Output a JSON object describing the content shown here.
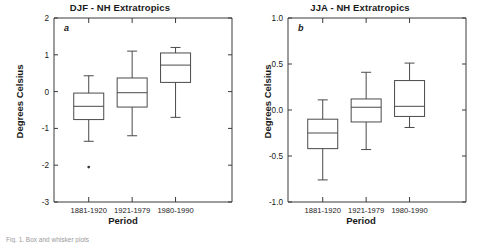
{
  "figure": {
    "caption": "Fig. 1. Box and whisker plots"
  },
  "panels": [
    {
      "letter": "a",
      "title": "DJF - NH Extratropics",
      "ylabel": "Degrees Celsius",
      "xlabel": "Period"
    },
    {
      "letter": "b",
      "title": "JJA - NH Extratropics",
      "ylabel": "Degrees Celsius",
      "xlabel": "Period"
    }
  ],
  "chart_data": [
    {
      "type": "box",
      "title": "DJF - NH Extratropics",
      "panel_letter": "a",
      "xlabel": "Period",
      "ylabel": "Degrees Celsius",
      "categories": [
        "1881-1920",
        "1921-1979",
        "1980-1990"
      ],
      "ylim": [
        -3,
        2
      ],
      "yticks": [
        2,
        1,
        0,
        -1,
        -2,
        -3
      ],
      "ytick_labels": [
        "2",
        "1",
        "0",
        "-1",
        "-2",
        "-3"
      ],
      "grid": false,
      "legend": "none",
      "boxes": [
        {
          "category": "1881-1920",
          "whisker_high": 0.43,
          "q3": -0.04,
          "median": -0.4,
          "q1": -0.76,
          "whisker_low": -1.35,
          "outliers": [
            -2.05
          ]
        },
        {
          "category": "1921-1979",
          "whisker_high": 1.1,
          "q3": 0.37,
          "median": -0.03,
          "q1": -0.42,
          "whisker_low": -1.2,
          "outliers": []
        },
        {
          "category": "1980-1990",
          "whisker_high": 1.2,
          "q3": 1.05,
          "median": 0.72,
          "q1": 0.25,
          "whisker_low": -0.7,
          "outliers": []
        }
      ]
    },
    {
      "type": "box",
      "title": "JJA - NH Extratropics",
      "panel_letter": "b",
      "xlabel": "Period",
      "ylabel": "Degrees Celsius",
      "categories": [
        "1881-1920",
        "1921-1979",
        "1980-1990"
      ],
      "ylim": [
        -1.0,
        1.0
      ],
      "yticks": [
        1.0,
        0.5,
        0.0,
        -0.5,
        -1.0
      ],
      "ytick_labels": [
        "1.0",
        "0.5",
        "0.0",
        "-0.5",
        "-1.0"
      ],
      "grid": false,
      "legend": "none",
      "boxes": [
        {
          "category": "1881-1920",
          "whisker_high": 0.11,
          "q3": -0.1,
          "median": -0.25,
          "q1": -0.42,
          "whisker_low": -0.76,
          "outliers": []
        },
        {
          "category": "1921-1979",
          "whisker_high": 0.41,
          "q3": 0.12,
          "median": 0.03,
          "q1": -0.13,
          "whisker_low": -0.43,
          "outliers": []
        },
        {
          "category": "1980-1990",
          "whisker_high": 0.51,
          "q3": 0.32,
          "median": 0.04,
          "q1": -0.07,
          "whisker_low": -0.19,
          "outliers": []
        }
      ]
    }
  ]
}
